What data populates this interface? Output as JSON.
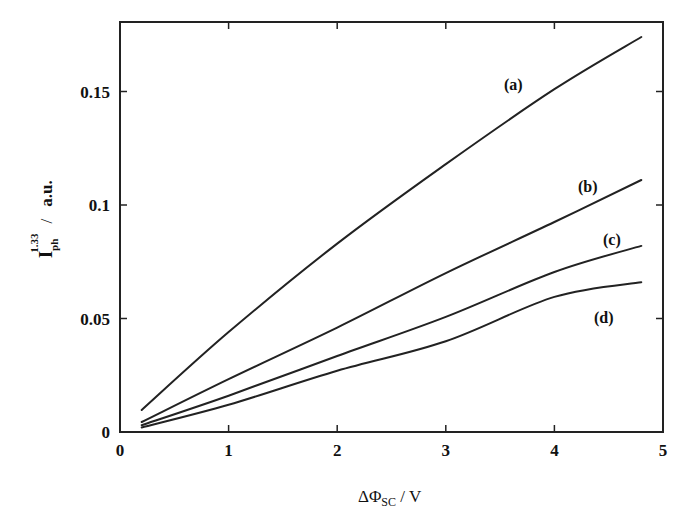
{
  "chart_data": {
    "type": "line",
    "title": "",
    "xlabel": "ΔΦSC / V",
    "ylabel": "Iph^1.33 / a.u.",
    "xlim": [
      0,
      5
    ],
    "ylim": [
      0,
      0.19
    ],
    "x_ticks": [
      0,
      1,
      2,
      3,
      4,
      5
    ],
    "x_tick_labels": [
      "0",
      "1",
      "2",
      "3",
      "4",
      "5"
    ],
    "y_ticks": [
      0,
      0.05,
      0.1,
      0.15
    ],
    "y_tick_labels": [
      "0",
      "0.05",
      "0.1",
      "0.15"
    ],
    "grid": false,
    "legend": "inline labels at right end of curves",
    "x": [
      0.2,
      1,
      2,
      3,
      4,
      4.8
    ],
    "series": [
      {
        "name": "(a)",
        "values": [
          0.0097,
          0.044,
          0.083,
          0.118,
          0.151,
          0.174
        ]
      },
      {
        "name": "(b)",
        "values": [
          0.0044,
          0.0233,
          0.046,
          0.07,
          0.0925,
          0.111
        ]
      },
      {
        "name": "(c)",
        "values": [
          0.003,
          0.016,
          0.0335,
          0.0507,
          0.0705,
          0.082
        ]
      },
      {
        "name": "(d)",
        "values": [
          0.002,
          0.012,
          0.027,
          0.04,
          0.0595,
          0.066
        ]
      }
    ]
  },
  "axes": {
    "x_title_main": "ΔΦ",
    "x_title_sub": "SC",
    "x_title_unit": " / V",
    "y_title_main": "I",
    "y_title_sub": "ph",
    "y_title_sup": "1.33",
    "y_title_slash": "/",
    "y_title_unit": "a.u."
  },
  "labels": {
    "a": "(a)",
    "b": "(b)",
    "c": "(c)",
    "d": "(d)"
  }
}
